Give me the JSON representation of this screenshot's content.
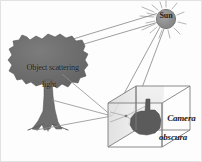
{
  "diagram": {
    "background_color": "#fdfdfd",
    "labels": {
      "sun": "Sun",
      "object_line1": "Object scattering",
      "object_line2": "light",
      "camera_line1": "Camera",
      "camera_line2": "obscura"
    },
    "colors": {
      "sun_fill": "#8c8c8c",
      "sun_stroke": "#6f6f6f",
      "sun_ray": "#9a9a9a",
      "tree_fill": "#6e6e6e",
      "tree_stroke": "#555555",
      "trunk_fill": "#707070",
      "light_ray": "#8a8a8a",
      "box_stroke": "#7a7a7a",
      "box_face": "#e9e9e9",
      "projection_fill": "#5c5c5c",
      "border": "#d8d8d8"
    },
    "elements": {
      "sun": {
        "cx": 166,
        "cy": 19,
        "r": 9.5,
        "ray_count": 12
      },
      "tree": {
        "crown_cx": 48,
        "crown_cy": 62,
        "crown_rx": 38,
        "crown_ry": 27,
        "trunk_x": 48,
        "trunk_top": 82,
        "trunk_bottom": 128
      },
      "box": {
        "front_left": 108,
        "front_right": 162,
        "front_top": 103,
        "front_bottom": 147,
        "depth_dx": 28,
        "depth_dy": -18
      },
      "pinhole": {
        "x": 112,
        "y": 116
      }
    },
    "rays": [
      {
        "name": "sun-to-tree-upper",
        "from": [
          157,
          14
        ],
        "to": [
          28,
          54
        ]
      },
      {
        "name": "sun-to-tree-lower",
        "from": [
          158,
          22
        ],
        "to": [
          30,
          60
        ]
      },
      {
        "name": "tree-top-to-pinhole",
        "from": [
          44,
          57
        ],
        "to": [
          112,
          116
        ]
      },
      {
        "name": "tree-base-to-pinhole",
        "from": [
          36,
          128
        ],
        "to": [
          112,
          116
        ]
      },
      {
        "name": "pinhole-to-projection-top",
        "from": [
          112,
          116
        ],
        "to": [
          146,
          106
        ]
      },
      {
        "name": "pinhole-to-projection-bottom",
        "from": [
          112,
          116
        ],
        "to": [
          146,
          138
        ]
      }
    ]
  }
}
